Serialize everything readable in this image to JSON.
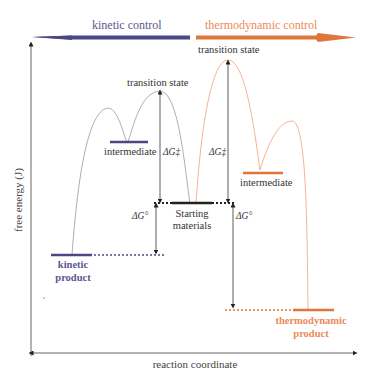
{
  "colors": {
    "kinetic": "#4a4785",
    "kinetic_text": "#5a5790",
    "thermodynamic": "#e0763a",
    "thermodynamic_text": "#ec8a5a",
    "axis": "#555555",
    "curve_kinetic": "#999999",
    "curve_thermo": "#f0a07a",
    "text": "#333333"
  },
  "banner": {
    "kinetic_label": "kinetic control",
    "thermodynamic_label": "thermodynamic control"
  },
  "axes": {
    "y_label": "free energy (J)",
    "x_label": "reaction coordinate"
  },
  "kinetic_side": {
    "transition_state_label": "transition state",
    "intermediate_label": "intermediate",
    "activation_label": "ΔG‡",
    "delta_g_label": "ΔG°",
    "product_label_line1": "kinetic",
    "product_label_line2": "product"
  },
  "thermodynamic_side": {
    "transition_state_label": "transition state",
    "intermediate_label": "intermediate",
    "activation_label": "ΔG‡",
    "delta_g_label": "ΔG°",
    "product_label_line1": "thermodynamic",
    "product_label_line2": "product"
  },
  "start": {
    "label_line1": "Starting",
    "label_line2": "materials"
  }
}
